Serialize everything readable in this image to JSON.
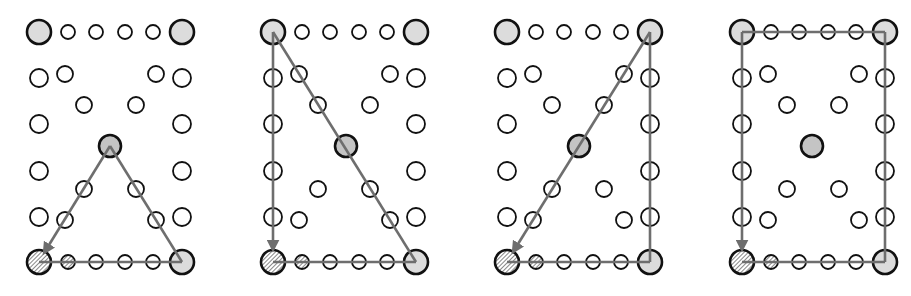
{
  "colors": {
    "background": "#ffffff",
    "stroke": "#111111",
    "corner_fill": "#dcdcdc",
    "center_fill": "#c4c4c4",
    "hatch_fill": "#9a9a9a",
    "path_line": "#6e6e6e",
    "empty_fill": "#ffffff"
  },
  "grid": {
    "left_x": 39,
    "right_x": 182,
    "rows_y": [
      32,
      78,
      124,
      171,
      217,
      262
    ],
    "edge_xs": [
      68,
      96,
      125,
      153
    ],
    "inner_points": [
      [
        65,
        74
      ],
      [
        156,
        74
      ],
      [
        84,
        105
      ],
      [
        136,
        105
      ],
      [
        84,
        189
      ],
      [
        136,
        189
      ],
      [
        65,
        220
      ],
      [
        156,
        220
      ]
    ],
    "center": [
      110,
      146
    ]
  },
  "panels": [
    {
      "name": "panel-triangle-up",
      "offset_x": 0,
      "center_dx": 0,
      "paths": [
        {
          "points": [
            [
              39,
              262
            ],
            [
              182,
              262
            ]
          ],
          "arrow": false
        },
        {
          "points": [
            [
              182,
              262
            ],
            [
              110,
              146
            ]
          ],
          "arrow": false
        },
        {
          "points": [
            [
              110,
              146
            ],
            [
              44,
              253
            ]
          ],
          "arrow": true
        }
      ],
      "inner_points": [
        [
          65,
          74
        ],
        [
          156,
          74
        ],
        [
          84,
          105
        ],
        [
          136,
          105
        ],
        [
          84,
          189
        ],
        [
          136,
          189
        ],
        [
          65,
          220
        ],
        [
          156,
          220
        ]
      ]
    },
    {
      "name": "panel-diagonal-right",
      "offset_x": 234,
      "center_dx": 2,
      "paths": [
        {
          "points": [
            [
              39,
              262
            ],
            [
              182,
              262
            ]
          ],
          "arrow": false
        },
        {
          "points": [
            [
              182,
              262
            ],
            [
              39,
              32
            ]
          ],
          "arrow": false
        },
        {
          "points": [
            [
              39,
              32
            ],
            [
              39,
              250
            ]
          ],
          "arrow": true
        }
      ],
      "inner_points": [
        [
          65,
          74
        ],
        [
          156,
          74
        ],
        [
          84,
          105
        ],
        [
          136,
          105
        ],
        [
          84,
          189
        ],
        [
          136,
          189
        ],
        [
          65,
          220
        ],
        [
          156,
          220
        ]
      ]
    },
    {
      "name": "panel-diagonal-left",
      "offset_x": 468,
      "center_dx": 1,
      "paths": [
        {
          "points": [
            [
              39,
              262
            ],
            [
              182,
              262
            ]
          ],
          "arrow": false
        },
        {
          "points": [
            [
              182,
              262
            ],
            [
              182,
              32
            ]
          ],
          "arrow": false
        },
        {
          "points": [
            [
              182,
              32
            ],
            [
              45,
              252
            ]
          ],
          "arrow": true
        }
      ],
      "inner_points": [
        [
          65,
          74
        ],
        [
          156,
          74
        ],
        [
          84,
          105
        ],
        [
          136,
          105
        ],
        [
          84,
          189
        ],
        [
          136,
          189
        ],
        [
          65,
          220
        ],
        [
          156,
          220
        ]
      ]
    },
    {
      "name": "panel-rectangle",
      "offset_x": 703,
      "center_dx": -1,
      "paths": [
        {
          "points": [
            [
              39,
              262
            ],
            [
              182,
              262
            ]
          ],
          "arrow": false
        },
        {
          "points": [
            [
              182,
              262
            ],
            [
              182,
              32
            ]
          ],
          "arrow": false
        },
        {
          "points": [
            [
              182,
              32
            ],
            [
              39,
              32
            ]
          ],
          "arrow": false
        },
        {
          "points": [
            [
              39,
              32
            ],
            [
              39,
              250
            ]
          ],
          "arrow": true
        }
      ],
      "inner_points": [
        [
          65,
          74
        ],
        [
          156,
          74
        ],
        [
          84,
          105
        ],
        [
          136,
          105
        ],
        [
          84,
          189
        ],
        [
          136,
          189
        ],
        [
          65,
          220
        ],
        [
          156,
          220
        ]
      ]
    }
  ]
}
